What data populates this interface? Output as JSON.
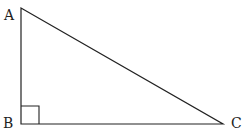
{
  "diagram": {
    "type": "right-triangle",
    "vertices": [
      {
        "label": "A",
        "x": 21,
        "y": 8
      },
      {
        "label": "B",
        "x": 21,
        "y": 124
      },
      {
        "label": "C",
        "x": 223,
        "y": 124
      }
    ],
    "right_angle_at": "B",
    "stroke_color": "#222222"
  }
}
